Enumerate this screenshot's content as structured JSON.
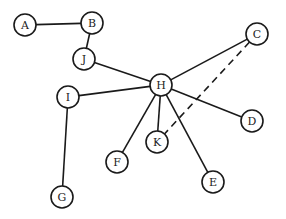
{
  "diagram": {
    "type": "graph",
    "node_radius": 11,
    "nodes": [
      {
        "id": "A",
        "label": "A",
        "x": 25,
        "y": 25
      },
      {
        "id": "B",
        "label": "B",
        "x": 92,
        "y": 23
      },
      {
        "id": "J",
        "label": "J",
        "x": 84,
        "y": 59
      },
      {
        "id": "C",
        "label": "C",
        "x": 257,
        "y": 34
      },
      {
        "id": "H",
        "label": "H",
        "x": 161,
        "y": 85
      },
      {
        "id": "I",
        "label": "I",
        "x": 68,
        "y": 97
      },
      {
        "id": "D",
        "label": "D",
        "x": 252,
        "y": 121
      },
      {
        "id": "K",
        "label": "K",
        "x": 157,
        "y": 142
      },
      {
        "id": "F",
        "label": "F",
        "x": 117,
        "y": 162
      },
      {
        "id": "E",
        "label": "E",
        "x": 213,
        "y": 182
      },
      {
        "id": "G",
        "label": "G",
        "x": 62,
        "y": 197
      }
    ],
    "edges": [
      {
        "from": "A",
        "to": "B",
        "style": "solid"
      },
      {
        "from": "B",
        "to": "J",
        "style": "solid"
      },
      {
        "from": "J",
        "to": "H",
        "style": "solid"
      },
      {
        "from": "I",
        "to": "H",
        "style": "solid"
      },
      {
        "from": "I",
        "to": "G",
        "style": "solid"
      },
      {
        "from": "H",
        "to": "C",
        "style": "solid"
      },
      {
        "from": "H",
        "to": "D",
        "style": "solid"
      },
      {
        "from": "H",
        "to": "K",
        "style": "solid"
      },
      {
        "from": "H",
        "to": "F",
        "style": "solid"
      },
      {
        "from": "H",
        "to": "E",
        "style": "solid"
      },
      {
        "from": "C",
        "to": "K",
        "style": "dashed"
      }
    ]
  }
}
